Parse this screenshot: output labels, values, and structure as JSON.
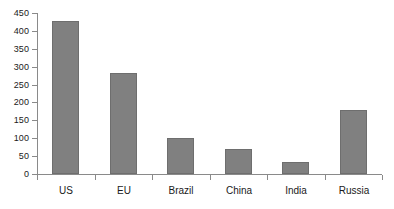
{
  "chart_data": {
    "type": "bar",
    "title": "",
    "subtitle": "",
    "xlabel": "",
    "ylabel": "",
    "categories": [
      "US",
      "EU",
      "Brazil",
      "China",
      "India",
      "Russia"
    ],
    "values": [
      428,
      282,
      101,
      70,
      34,
      179
    ],
    "ylim": [
      0,
      450
    ],
    "ytick_step": 50,
    "ytick_labels": [
      "450",
      "400",
      "350",
      "300",
      "250",
      "200",
      "150",
      "100",
      "50",
      "0"
    ],
    "ytick_values": [
      450,
      400,
      350,
      300,
      250,
      200,
      150,
      100,
      50,
      0
    ],
    "grid": false,
    "legend": false,
    "legend_position": "none",
    "bar_color": "#808080",
    "bar_border_color": "#6e6e6e",
    "axis_color": "#8a8a8a",
    "text_color": "#1a1a1a",
    "background_color": "#ffffff"
  }
}
